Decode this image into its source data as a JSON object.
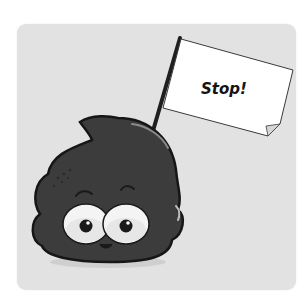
{
  "illustration": {
    "subject": "cartoon poop character holding a flag",
    "flag": {
      "text": "Stop!"
    },
    "colors": {
      "page_background": "#ffffff",
      "card_background": "#e2e2e2",
      "character_body": "#3c3c3c",
      "outline": "#1a1a1a",
      "flag": "#ffffff",
      "eye_white": "#f4f4f4"
    }
  }
}
